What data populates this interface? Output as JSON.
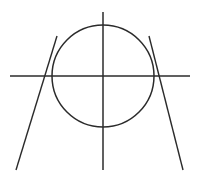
{
  "figure": {
    "background_color": "#ffffff",
    "stroke_color": "#2b2b2b",
    "canvas": {
      "width": 199,
      "height": 181
    },
    "elements": [
      {
        "name": "circle",
        "type": "circle",
        "center_x": 103,
        "center_y": 76,
        "radius": 51,
        "stroke_width": 1.5,
        "color": "#2b2b2b"
      },
      {
        "name": "horizontal-axis-line",
        "type": "line",
        "x1": 10,
        "y1": 76,
        "x2": 190,
        "y2": 76,
        "stroke_width": 1.5,
        "color": "#2b2b2b"
      },
      {
        "name": "vertical-axis-line",
        "type": "line",
        "x1": 103,
        "y1": 12,
        "x2": 103,
        "y2": 170,
        "stroke_width": 1.5,
        "color": "#2b2b2b"
      },
      {
        "name": "left-secant-line",
        "type": "line",
        "x1": 57,
        "y1": 36,
        "x2": 16,
        "y2": 170,
        "stroke_width": 1.4,
        "color": "#2b2b2b"
      },
      {
        "name": "right-secant-line",
        "type": "line",
        "x1": 149,
        "y1": 36,
        "x2": 183,
        "y2": 170,
        "stroke_width": 1.4,
        "color": "#2b2b2b"
      }
    ],
    "intersections": [
      {
        "name": "center-point",
        "x": 103,
        "y": 76
      },
      {
        "name": "left-crossing-point",
        "x": 53,
        "y": 76
      },
      {
        "name": "right-crossing-point",
        "x": 153,
        "y": 76
      },
      {
        "name": "circle-top-point",
        "x": 103,
        "y": 25
      },
      {
        "name": "circle-bottom-point",
        "x": 103,
        "y": 127
      }
    ]
  }
}
